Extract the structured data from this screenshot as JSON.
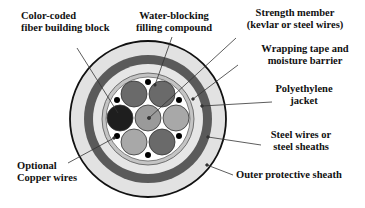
{
  "labels": {
    "fiber_block": {
      "line1": "Color-coded",
      "line2": "fiber building block"
    },
    "water_blocking": {
      "line1": "Water-blocking",
      "line2": "filling compound"
    },
    "strength_member": {
      "line1": "Strength member",
      "line2": "(kevlar or steel wires)"
    },
    "wrapping_tape": {
      "line1": "Wrapping tape and",
      "line2": "moisture barrier"
    },
    "polyethylene": {
      "line1": "Polyethylene",
      "line2": "jacket"
    },
    "steel_wires": {
      "line1": "Steel wires or",
      "line2": "steel sheaths"
    },
    "outer_sheath": {
      "line1": "Outer protective sheath"
    },
    "copper_wires": {
      "line1": "Optional",
      "line2": "Copper wires"
    }
  },
  "colors": {
    "outer_sheath": "#e2e2e2",
    "steel_layer": "#5a5a5a",
    "jacket": "#e8e8e8",
    "tape": "#bdbdbd",
    "filling": "#ffffff",
    "fiber_dark": "#1e1e1e",
    "fiber_mid": "#6a6a6a",
    "fiber_light": "#a8a8a8",
    "fiber_center": "#9a9a9a",
    "copper_dot": "#000000",
    "outline": "#111111"
  }
}
